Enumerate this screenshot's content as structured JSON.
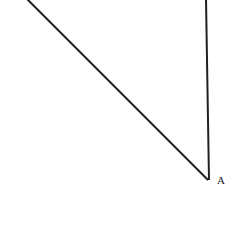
{
  "figure": {
    "kind": "geometry-diagram",
    "width": 237,
    "height": 245,
    "background_color": "#ffffff",
    "stroke_color": "#231f20",
    "stroke_width": 2,
    "labels": [
      {
        "id": "A",
        "text": "A",
        "x": 220,
        "y": 181
      }
    ],
    "vertices": {
      "A": {
        "x": 208,
        "y": 180
      }
    },
    "segments": [
      {
        "name": "diagonal-segment",
        "x1": 27,
        "y1": -1,
        "x2": 208,
        "y2": 180
      },
      {
        "name": "vertical-segment",
        "x1": 206,
        "y1": -1,
        "x2": 209,
        "y2": 180
      }
    ]
  },
  "label_a": "A"
}
